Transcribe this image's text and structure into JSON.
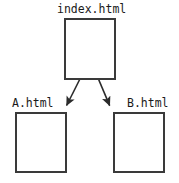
{
  "diagram": {
    "background_color": "#ffffff",
    "stroke_color": "#3a3a3a",
    "text_color": "#1a1a1a",
    "canvas": {
      "width": 179,
      "height": 183
    },
    "nodes": [
      {
        "id": "index",
        "label": "index.html",
        "x": 64,
        "y": 18,
        "width": 52,
        "height": 62,
        "label_x": 57,
        "label_y": 3,
        "label_position": "above-center"
      },
      {
        "id": "a",
        "label": "A.html",
        "x": 15,
        "y": 112,
        "width": 52,
        "height": 61,
        "label_x": 12,
        "label_y": 97,
        "label_position": "above-left"
      },
      {
        "id": "b",
        "label": "B.html",
        "x": 113,
        "y": 112,
        "width": 52,
        "height": 61,
        "label_x": 127,
        "label_y": 97,
        "label_position": "above-right"
      }
    ],
    "edges": [
      {
        "id": "index-to-a",
        "from": "index",
        "to": "a",
        "start_x": 90,
        "start_y": 59,
        "end_x": 64,
        "end_y": 110,
        "arrowhead": "filled-triangle"
      },
      {
        "id": "index-to-b",
        "from": "index",
        "to": "b",
        "start_x": 90,
        "start_y": 59,
        "end_x": 112,
        "end_y": 110,
        "arrowhead": "filled-triangle"
      }
    ]
  }
}
